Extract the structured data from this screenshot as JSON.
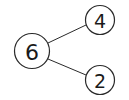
{
  "diagram": {
    "type": "number-bond",
    "whole": {
      "label": "6",
      "cx": 32,
      "cy": 51,
      "r": 17.5
    },
    "parts": [
      {
        "label": "4",
        "cx": 100,
        "cy": 20,
        "r": 14.5
      },
      {
        "label": "2",
        "cx": 100,
        "cy": 80,
        "r": 14.5
      }
    ],
    "colors": {
      "stroke": "#2a2a2a",
      "text": "#1a1a1a",
      "background": "#ffffff"
    }
  }
}
